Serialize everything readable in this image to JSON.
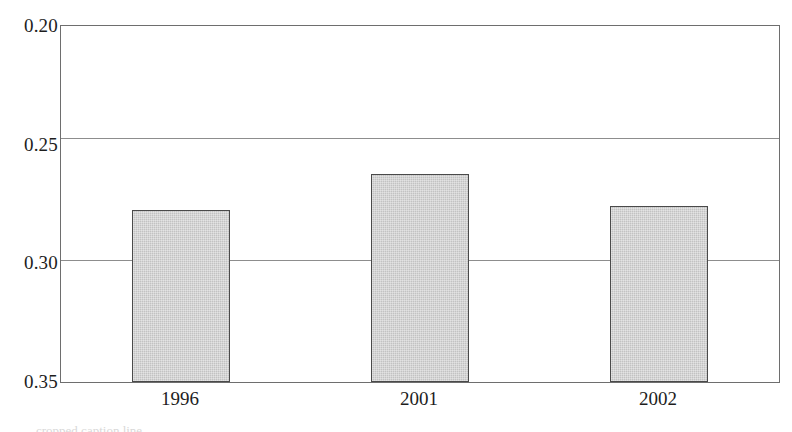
{
  "chart_data": {
    "type": "bar",
    "title": "",
    "subtitle": "",
    "xlabel": "",
    "ylabel": "",
    "categories": [
      "1996",
      "2001",
      "2002"
    ],
    "values": [
      0.2725,
      0.2875,
      0.274
    ],
    "series": [
      {
        "name": "",
        "values": [
          0.2725,
          0.2875,
          0.274
        ]
      }
    ],
    "ylim": [
      0.2,
      0.35
    ],
    "yticks": [
      0.2,
      0.25,
      0.3,
      0.35
    ],
    "ytick_labels": [
      "0.20",
      "0.25",
      "0.30",
      "0.35"
    ],
    "gridlines": [
      "0.25",
      "0.30"
    ],
    "grid": true,
    "legend": null,
    "legend_position": "none",
    "bar_fill_color": "#c9c9c9",
    "bar_edge_color": "#4a4a4a",
    "axis_color": "#6e6e6e",
    "grid_color": "#8d8d8d",
    "background_color": "#ffffff"
  },
  "axis": {
    "y_labels": [
      {
        "text": "0.35",
        "value": 0.35
      },
      {
        "text": "0.30",
        "value": 0.3
      },
      {
        "text": "0.25",
        "value": 0.25
      },
      {
        "text": "0.20",
        "value": 0.2
      }
    ],
    "x_labels": [
      {
        "text": "1996"
      },
      {
        "text": "2001"
      },
      {
        "text": "2002"
      }
    ]
  },
  "caption": {
    "text": "cropped caption line"
  }
}
